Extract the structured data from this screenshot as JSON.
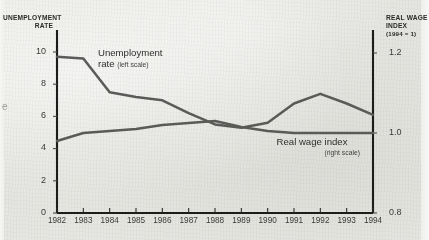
{
  "chart_data": {
    "type": "line",
    "title": "",
    "xlabel": "",
    "categories": [
      "1982",
      "1983",
      "1984",
      "1985",
      "1986",
      "1987",
      "1988",
      "1989",
      "1990",
      "1991",
      "1992",
      "1993",
      "1994"
    ],
    "grid": false,
    "legend_position": "inline-annotations",
    "axes": {
      "left": {
        "header_line1": "UNEMPLOYMENT",
        "header_line2": "RATE",
        "ticks": [
          "10",
          "8",
          "6",
          "4",
          "2",
          "0"
        ],
        "tick_values": [
          10,
          8,
          6,
          4,
          2,
          0
        ],
        "ylim": [
          0,
          10.8
        ]
      },
      "right": {
        "header_line1": "REAL WAGE",
        "header_line2": "INDEX",
        "header_line3": "(1994 = 1)",
        "ticks": [
          "1.2",
          "1.0",
          "0.8"
        ],
        "tick_values": [
          1.2,
          1.0,
          0.8
        ],
        "ylim": [
          0.8,
          1.2
        ]
      }
    },
    "series": [
      {
        "name": "Unemployment rate",
        "label_line1": "Unemployment",
        "label_line2": "rate",
        "scale_note": "(left scale)",
        "axis": "left",
        "color": "#5a5a58",
        "values": [
          9.7,
          9.6,
          7.5,
          7.2,
          7.0,
          6.2,
          5.5,
          5.3,
          5.6,
          6.8,
          7.4,
          6.8,
          6.1
        ]
      },
      {
        "name": "Real wage index",
        "label_line1": "Real wage index",
        "scale_note": "(right scale)",
        "axis": "right",
        "color": "#5a5a58",
        "values": [
          0.98,
          1.0,
          1.005,
          1.01,
          1.02,
          1.025,
          1.03,
          1.015,
          1.005,
          1.0,
          1.0,
          1.0,
          1.0
        ]
      }
    ]
  },
  "margin": {
    "cut_glyph": "e"
  },
  "colors": {
    "line": "#5a5a58",
    "axis": "#1c1c1a",
    "text": "#2a2a28",
    "background": "#e9e9e6"
  }
}
